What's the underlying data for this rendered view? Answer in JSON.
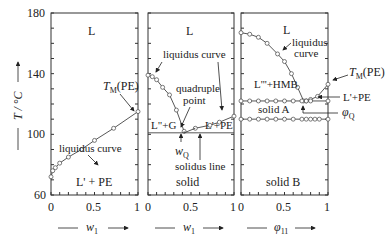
{
  "chart_data": {
    "type": "scatter",
    "title": "",
    "ylabel": "T / °C",
    "ylim": [
      60,
      180
    ],
    "yticks": [
      60,
      100,
      140,
      180
    ],
    "panels": [
      {
        "xlabel": "w1",
        "xlim": [
          0,
          1
        ],
        "xticks": [
          "0",
          "0.5",
          "1"
        ],
        "regions": [
          "L",
          "L' + PE"
        ],
        "annotations": [
          "liquidus curve",
          "T_M(PE)"
        ],
        "series": [
          {
            "name": "liquidus data",
            "x": [
              0.0,
              0.02,
              0.05,
              0.1,
              0.2,
              0.35,
              0.5,
              0.72,
              1.0
            ],
            "y": [
              72,
              76,
              78,
              81,
              85,
              90,
              96,
              104,
              115
            ]
          }
        ]
      },
      {
        "xlabel": "w1",
        "xlim": [
          0,
          1
        ],
        "xticks": [
          "0",
          "0.5",
          "1"
        ],
        "regions": [
          "L",
          "L\"+G",
          "L'+PE",
          "solid"
        ],
        "annotations": [
          "liquidus curve",
          "quadruple point",
          "w_Q",
          "solidus line"
        ],
        "series": [
          {
            "name": "liquidus left branch",
            "x": [
              0.0,
              0.05,
              0.1,
              0.17,
              0.25,
              0.33,
              0.42
            ],
            "y": [
              139,
              138,
              136,
              131,
              126,
              116,
              102
            ]
          },
          {
            "name": "liquidus right branch",
            "x": [
              0.55,
              0.72,
              0.83,
              1.0
            ],
            "y": [
              104,
              106,
              108,
              112
            ]
          },
          {
            "name": "solidus line",
            "x": [
              0.0,
              1.0
            ],
            "y": [
              101,
              101
            ]
          }
        ],
        "quadruple_point": {
          "w_Q": 0.42,
          "T": 101
        }
      },
      {
        "xlabel": "φ11",
        "xlim": [
          0,
          1
        ],
        "xticks": [
          "0",
          "0.5",
          "1"
        ],
        "regions": [
          "L",
          "L'''+HMB",
          "solid A",
          "solid B",
          "L'+PE"
        ],
        "annotations": [
          "liquidus curve",
          "T_M(PE)",
          "L'+PE",
          "φQ"
        ],
        "series": [
          {
            "name": "liquidus",
            "x": [
              0.0,
              0.1,
              0.2,
              0.3,
              0.42,
              0.5,
              0.58,
              0.65,
              0.72
            ],
            "y": [
              167,
              166,
              164,
              160,
              153,
              148,
              140,
              131,
              122
            ]
          },
          {
            "name": "PE liquidus",
            "x": [
              0.75,
              0.8,
              0.88,
              1.0
            ],
            "y": [
              122,
              123,
              125,
              133
            ]
          },
          {
            "name": "solid A/L boundary",
            "x": [
              0.0,
              0.1,
              0.2,
              0.3,
              0.4,
              0.5,
              0.6,
              0.7,
              0.75,
              0.8,
              1.0
            ],
            "y": [
              122,
              122,
              122,
              122,
              122,
              122,
              122,
              122,
              122,
              122,
              122
            ]
          },
          {
            "name": "solid A/B boundary",
            "x": [
              0.0,
              0.1,
              0.2,
              0.3,
              0.4,
              0.5,
              0.6,
              0.7,
              0.75,
              0.8,
              0.85,
              0.9,
              1.0
            ],
            "y": [
              110,
              110,
              110,
              110,
              110,
              110,
              110,
              110,
              110,
              110,
              110,
              110,
              110
            ]
          }
        ]
      }
    ]
  },
  "labels": {
    "y_axis": "T / °C",
    "y180": "180",
    "y140": "140",
    "y100": "100",
    "y60": "60",
    "x0": "0",
    "x05": "0.5",
    "x1": "1",
    "p1_L": "L",
    "p1_LPE": "L' + PE",
    "p1_liq": "liquidus curve",
    "p1_TM": "T",
    "p1_TM_sub": "M",
    "p1_TM_pe": "(PE)",
    "p2_L": "L",
    "p2_liq": "liquidus curve",
    "p2_quad1": "quadruple",
    "p2_quad2": "point",
    "p2_LG": "L\"+G",
    "p2_LPE": "L'+PE",
    "p2_wQ": "w",
    "p2_wQ_sub": "Q",
    "p2_sol": "solidus line",
    "p2_solid": "solid",
    "p3_L": "L",
    "p3_liq1": "liquidus",
    "p3_liq2": "curve",
    "p3_LHMB": "L'''+HMB",
    "p3_solidA": "solid A",
    "p3_solidB": "solid B",
    "p3_TM": "T",
    "p3_TM_sub": "M",
    "p3_TM_pe": "(PE)",
    "p3_LPE": "L'+PE",
    "p3_phiQ": "φ",
    "p3_phiQ_sub": "Q",
    "x1_label": "w",
    "x1_sub": "1",
    "x2_label": "w",
    "x2_sub": "1",
    "x3_label": "φ",
    "x3_sub": "11"
  }
}
